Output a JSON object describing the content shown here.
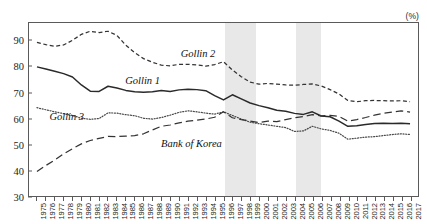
{
  "units_label": "(%)",
  "chart_data": {
    "type": "line",
    "title": "",
    "xlabel": "",
    "ylabel": "",
    "units": "(%)",
    "grid": false,
    "legend_position": "inline-annotations",
    "ylim": [
      30,
      97
    ],
    "yticks": [
      30,
      40,
      50,
      60,
      70,
      80,
      90
    ],
    "xlim": [
      1975,
      2017
    ],
    "x": [
      1975,
      1976,
      1977,
      1978,
      1979,
      1980,
      1981,
      1982,
      1983,
      1984,
      1985,
      1986,
      1987,
      1988,
      1989,
      1990,
      1991,
      1992,
      1993,
      1994,
      1995,
      1996,
      1997,
      1998,
      1999,
      2000,
      2001,
      2002,
      2003,
      2004,
      2005,
      2006,
      2007,
      2008,
      2009,
      2010,
      2011,
      2012,
      2013,
      2014,
      2015,
      2016,
      2017
    ],
    "xtick_labels": [
      "1975",
      "1976",
      "1977",
      "1978",
      "1979",
      "1980",
      "1981",
      "1982",
      "1983",
      "1984",
      "1985",
      "1986",
      "1987",
      "1988",
      "1989",
      "1990",
      "1991",
      "1992",
      "1993",
      "1994",
      "1995",
      "1996",
      "1997",
      "1998",
      "1999",
      "2000",
      "2001",
      "2002",
      "2003",
      "2004",
      "2005",
      "2006",
      "2007",
      "2008",
      "2009",
      "2010",
      "2011",
      "2012",
      "2013",
      "2014",
      "2015",
      "2016",
      "2017"
    ],
    "shaded_bands": [
      {
        "start": 1996,
        "end": 1999.5,
        "color": "#e8e8e8"
      },
      {
        "start": 2004,
        "end": 2006.8,
        "color": "#e8e8e8"
      }
    ],
    "series": [
      {
        "name": "Gollin 2",
        "style": "dashed",
        "color": "#333333",
        "label_x": 1991.2,
        "label_y": 84.5,
        "values": [
          89.5,
          88.6,
          88.0,
          88.5,
          90.3,
          92.6,
          93.8,
          93.3,
          93.8,
          92.2,
          88.4,
          85.5,
          83.2,
          81.8,
          80.7,
          80.4,
          81.0,
          81.0,
          80.8,
          80.3,
          80.9,
          82.0,
          78.8,
          76.2,
          74.1,
          73.3,
          73.6,
          73.3,
          73.0,
          72.9,
          73.2,
          73.4,
          72.6,
          71.2,
          69.5,
          67.0,
          66.5,
          66.9,
          67.0,
          66.9,
          66.8,
          66.9,
          66.5
        ]
      },
      {
        "name": "Gollin 1",
        "style": "solid",
        "color": "#2a2a2a",
        "label_x": 1985.0,
        "label_y": 74.0,
        "values": [
          80.0,
          79.2,
          78.3,
          77.4,
          76.1,
          73.0,
          70.6,
          70.5,
          72.5,
          71.8,
          70.9,
          70.4,
          70.2,
          70.4,
          70.9,
          70.5,
          71.1,
          71.3,
          71.2,
          70.8,
          68.9,
          67.2,
          69.2,
          67.6,
          66.0,
          65.0,
          64.2,
          63.2,
          62.8,
          62.0,
          61.6,
          62.6,
          61.0,
          60.7,
          59.0,
          57.0,
          57.2,
          57.7,
          58.1,
          58.2,
          58.1,
          58.2,
          58.0
        ]
      },
      {
        "name": "Gollin 3",
        "style": "dotted",
        "color": "#4a4a4a",
        "label_x": 1976.5,
        "label_y": 60.3,
        "values": [
          64.2,
          63.4,
          62.6,
          61.9,
          61.2,
          60.1,
          59.7,
          60.0,
          62.2,
          62.1,
          61.5,
          61.1,
          60.1,
          59.8,
          60.4,
          61.3,
          62.4,
          63.0,
          62.6,
          62.1,
          61.7,
          62.6,
          61.2,
          59.8,
          58.6,
          58.0,
          57.5,
          57.0,
          56.5,
          55.0,
          55.2,
          57.0,
          56.0,
          55.4,
          54.3,
          52.0,
          52.4,
          52.8,
          53.0,
          53.4,
          53.8,
          54.1,
          53.8
        ]
      },
      {
        "name": "Bank of Korea",
        "style": "longdash",
        "color": "#333333",
        "label_x": 1989.0,
        "label_y": 50.0,
        "values": [
          39.5,
          41.8,
          43.9,
          46.3,
          48.3,
          50.2,
          51.5,
          52.3,
          53.1,
          53.0,
          53.2,
          53.4,
          54.1,
          55.6,
          57.0,
          57.5,
          58.3,
          59.0,
          59.4,
          59.8,
          60.5,
          62.6,
          60.3,
          59.6,
          59.0,
          58.4,
          59.0,
          58.8,
          59.6,
          60.3,
          60.8,
          61.5,
          61.0,
          61.2,
          60.8,
          59.0,
          59.6,
          60.4,
          61.3,
          62.0,
          62.5,
          63.0,
          62.5
        ]
      }
    ]
  }
}
